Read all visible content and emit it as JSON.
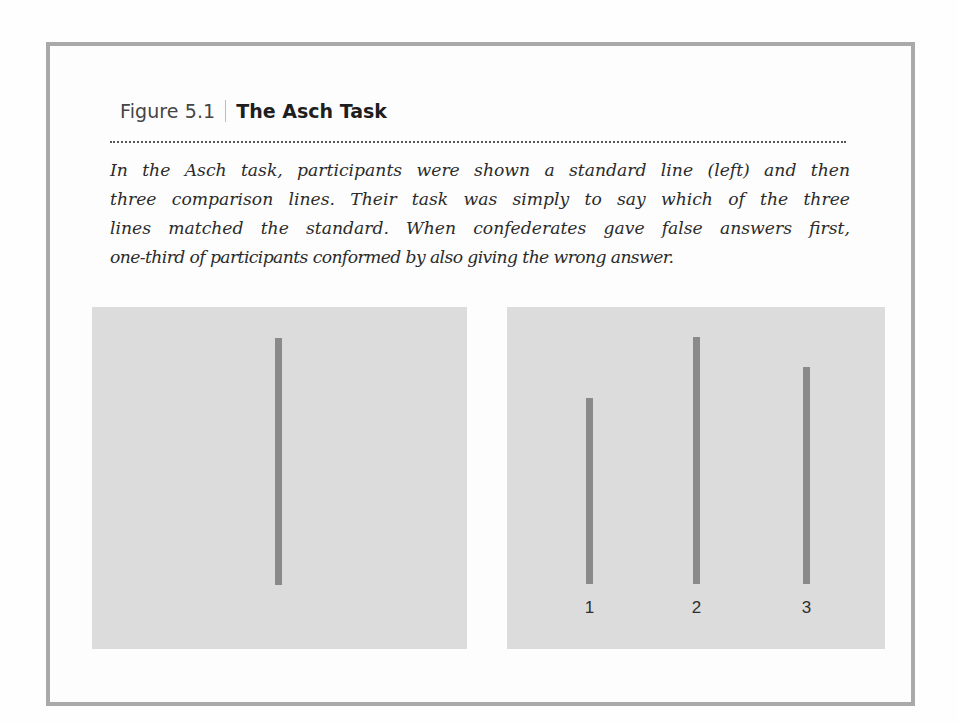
{
  "figure": {
    "number": "Figure 5.1",
    "title": "The Asch Task",
    "caption_lines": [
      "In the Asch task, participants were shown a standard line (left) and then",
      "three comparison lines. Their task was simply to say which of the three",
      "lines matched the standard. When confederates gave false answers first,",
      "one-third of participants conformed by also giving the wrong answer."
    ]
  },
  "panels": {
    "standard": {
      "label": "standard line",
      "line": {
        "x": 183,
        "top": 31,
        "height": 247
      }
    },
    "comparison": {
      "label": "comparison lines",
      "lines": [
        {
          "label": "1",
          "x": 79,
          "top": 91,
          "height": 186
        },
        {
          "label": "2",
          "x": 186,
          "top": 30,
          "height": 247
        },
        {
          "label": "3",
          "x": 296,
          "top": 60,
          "height": 217
        }
      ]
    }
  },
  "colors": {
    "border": "#a9a9a9",
    "panel_bg": "#dcdcdc",
    "line": "#8a8a8a"
  }
}
